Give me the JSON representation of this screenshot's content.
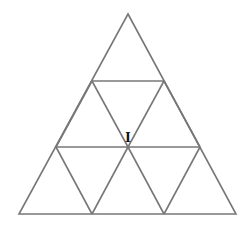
{
  "figure": {
    "background_color": "#ffffff",
    "line_color": "#777777",
    "line_width": 1.6,
    "label_color": "#111111",
    "canvas": {
      "width": 252,
      "height": 229
    }
  },
  "geometry": {
    "apex": {
      "x": 128,
      "y": 14
    },
    "base_left": {
      "x": 19,
      "y": 214
    },
    "base_right": {
      "x": 236,
      "y": 214
    },
    "rows": 3,
    "small_triangle_count": 9,
    "horizontal_dividers_y": [
      81,
      147
    ],
    "row1_horizontal": {
      "x1": 92,
      "x2": 164,
      "y": 81
    },
    "row2_horizontal": {
      "x1": 56,
      "x2": 200,
      "y": 147
    },
    "base_vertices_x": [
      19,
      92,
      164,
      236
    ],
    "center_vertex": {
      "x": 128,
      "y": 147
    }
  },
  "labels": {
    "center": {
      "text": "I",
      "x": 128,
      "y": 142,
      "font_size": 15
    }
  },
  "outline_points": "128,14 236,214 19,214",
  "interior_segments": [
    {
      "name": "upper-horizontal",
      "x1": 92,
      "y1": 81,
      "x2": 164,
      "y2": 81
    },
    {
      "name": "middle-horizontal",
      "x1": 56,
      "y1": 147,
      "x2": 200,
      "y2": 147
    },
    {
      "name": "left-down-upper",
      "x1": 92,
      "y1": 81,
      "x2": 56,
      "y2": 147
    },
    {
      "name": "right-down-upper",
      "x1": 164,
      "y1": 81,
      "x2": 200,
      "y2": 147
    },
    {
      "name": "inner-left-diagonal",
      "x1": 92,
      "y1": 81,
      "x2": 128,
      "y2": 147
    },
    {
      "name": "inner-right-diagonal",
      "x1": 164,
      "y1": 81,
      "x2": 128,
      "y2": 147
    },
    {
      "name": "left-lower-diagonal",
      "x1": 56,
      "y1": 147,
      "x2": 92,
      "y2": 214
    },
    {
      "name": "center-left-lower-diagonal",
      "x1": 128,
      "y1": 147,
      "x2": 92,
      "y2": 214
    },
    {
      "name": "center-right-lower-diagonal",
      "x1": 128,
      "y1": 147,
      "x2": 164,
      "y2": 214
    },
    {
      "name": "right-lower-diagonal",
      "x1": 200,
      "y1": 147,
      "x2": 164,
      "y2": 214
    }
  ]
}
